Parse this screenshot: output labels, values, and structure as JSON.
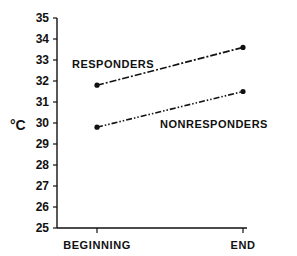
{
  "chart_data": {
    "type": "line",
    "title": "",
    "xlabel": "",
    "ylabel": "°C",
    "categories": [
      "BEGINNING",
      "END"
    ],
    "series": [
      {
        "name": "RESPONDERS",
        "values": [
          31.8,
          33.6
        ],
        "line_style": "dash-dot"
      },
      {
        "name": "NONRESPONDERS",
        "values": [
          29.8,
          31.5
        ],
        "line_style": "dash-dot-dot"
      }
    ],
    "ylim": [
      25,
      35
    ],
    "yticks": [
      25,
      26,
      27,
      28,
      29,
      30,
      31,
      32,
      33,
      34,
      35
    ],
    "grid": false,
    "legend": "inline labels near lines"
  },
  "labels": {
    "y_axis": "°C",
    "responders": "RESPONDERS",
    "nonresponders": "NONRESPONDERS",
    "x_beginning": "BEGINNING",
    "x_end": "END"
  },
  "colors": {
    "ink": "#111111",
    "background": "#ffffff"
  }
}
